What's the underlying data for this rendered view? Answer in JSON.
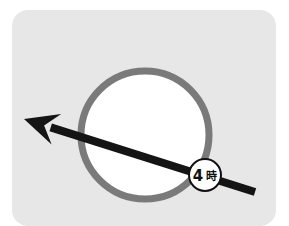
{
  "card": {
    "background_color": "#e7e7e7",
    "corner_radius": 16
  },
  "diagram": {
    "title_text": "",
    "circle": {
      "label": "clock-face-circle",
      "center_x": 145,
      "center_y": 135,
      "radius": 64,
      "stroke_color": "#7a7a7a",
      "stroke_width": 7,
      "fill_color": "#ffffff"
    },
    "arrow": {
      "label": "direction-arrow",
      "color": "#141414",
      "shaft_width": 8,
      "tail_x": 255,
      "tail_y": 192,
      "tip_x": 24,
      "tip_y": 119,
      "head_length": 34,
      "head_half_width": 16,
      "direction": "upper-left"
    },
    "badge": {
      "label": "time-marker-badge",
      "text_main": "4",
      "text_unit": "時",
      "full_text": "4時",
      "center_x": 205,
      "center_y": 175,
      "radius": 16,
      "fill_color": "#ffffff",
      "stroke_color": "#111111",
      "stroke_width": 2,
      "text_color": "#111111"
    }
  }
}
